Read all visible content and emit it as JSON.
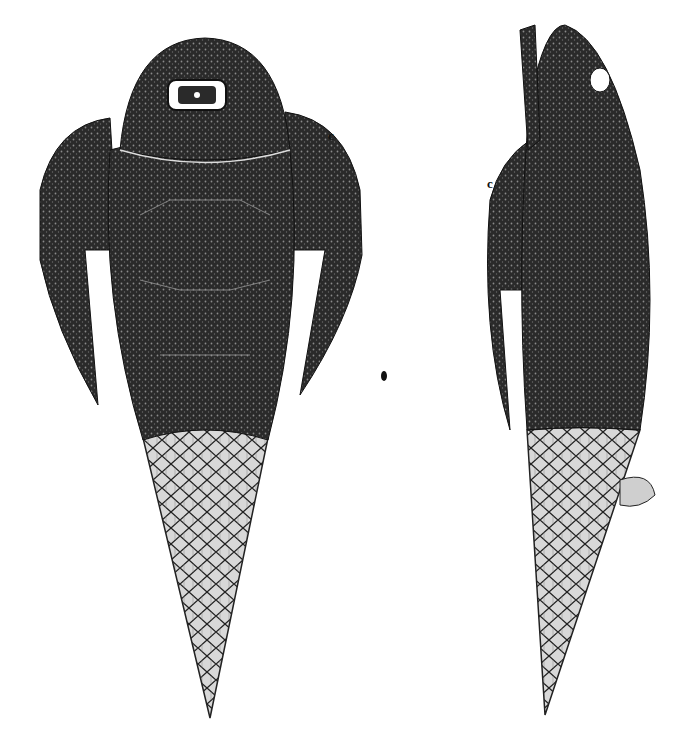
{
  "figure": {
    "views": [
      {
        "name": "dorsal-view",
        "label": "c",
        "label_pos": [
          330,
          138
        ]
      },
      {
        "name": "lateral-view",
        "label": "c",
        "label_pos": [
          487,
          184
        ]
      }
    ],
    "colors": {
      "ink": "#1a1a1a",
      "armor": "#2b2b2b",
      "tail": "#cfcfcf",
      "paper": "#ffffff"
    }
  }
}
